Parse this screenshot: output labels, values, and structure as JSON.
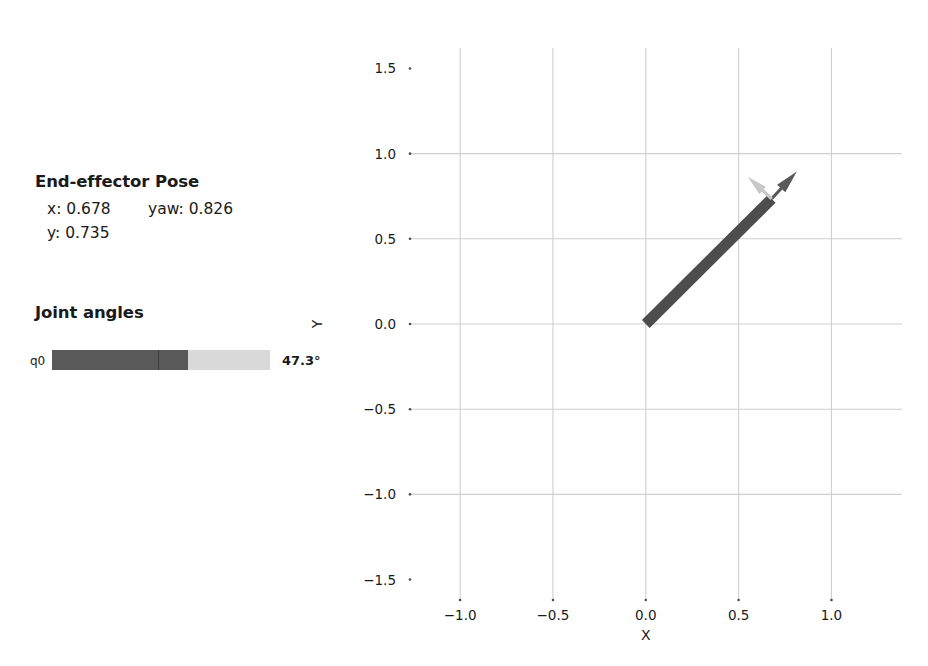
{
  "panel": {
    "pose": {
      "heading": "End-effector Pose",
      "x_label": "x: 0.678",
      "y_label": "y: 0.735",
      "yaw_label": "yaw: 0.826"
    },
    "joints": {
      "heading": "Joint angles",
      "rows": [
        {
          "name": "q0",
          "value_label": "47.3°",
          "value_deg": 47.3,
          "min_deg": -180,
          "max_deg": 180,
          "fill_fraction": 0.624,
          "center_fraction": 0.486
        }
      ]
    }
  },
  "colors": {
    "link": "#4d4d4d",
    "frame_x_arrow": "#595959",
    "frame_y_arrow": "#c8c8c8",
    "bar_track": "#d9d9d9",
    "bar_fill": "#595959",
    "bar_tick": "#3b3b3b",
    "grid": "#cfcfcf",
    "text": "#1a1a1a"
  },
  "chart_data": {
    "type": "scatter",
    "title": "",
    "xlabel": "X",
    "ylabel": "Y",
    "xlim": [
      -1.27,
      1.38
    ],
    "ylim": [
      -1.62,
      1.62
    ],
    "grid": true,
    "legend": null,
    "xticks": [
      -1.0,
      -0.5,
      0.0,
      0.5,
      1.0
    ],
    "xticklabels": [
      "-1.0",
      "-0.5",
      "0.0",
      "0.5",
      "1.0"
    ],
    "yticks": [
      -1.5,
      -1.0,
      -0.5,
      0.0,
      0.5,
      1.0,
      1.5
    ],
    "yticklabels": [
      "-1.5",
      "-1.0",
      "-0.5",
      "0.0",
      "0.5",
      "1.0",
      "1.5"
    ],
    "robot": {
      "base": [
        0.0,
        0.0
      ],
      "end_effector": [
        0.678,
        0.735
      ],
      "yaw": 0.826,
      "links": [
        {
          "from": [
            0.0,
            0.0
          ],
          "to": [
            0.678,
            0.735
          ],
          "width_px": 11,
          "color": "#4d4d4d"
        }
      ],
      "frame_arrows": [
        {
          "axis": "x",
          "angle_rad": 0.826,
          "length": 0.2,
          "color": "#595959"
        },
        {
          "axis": "y",
          "angle_rad": 2.397,
          "length": 0.175,
          "color": "#c8c8c8"
        }
      ]
    }
  }
}
